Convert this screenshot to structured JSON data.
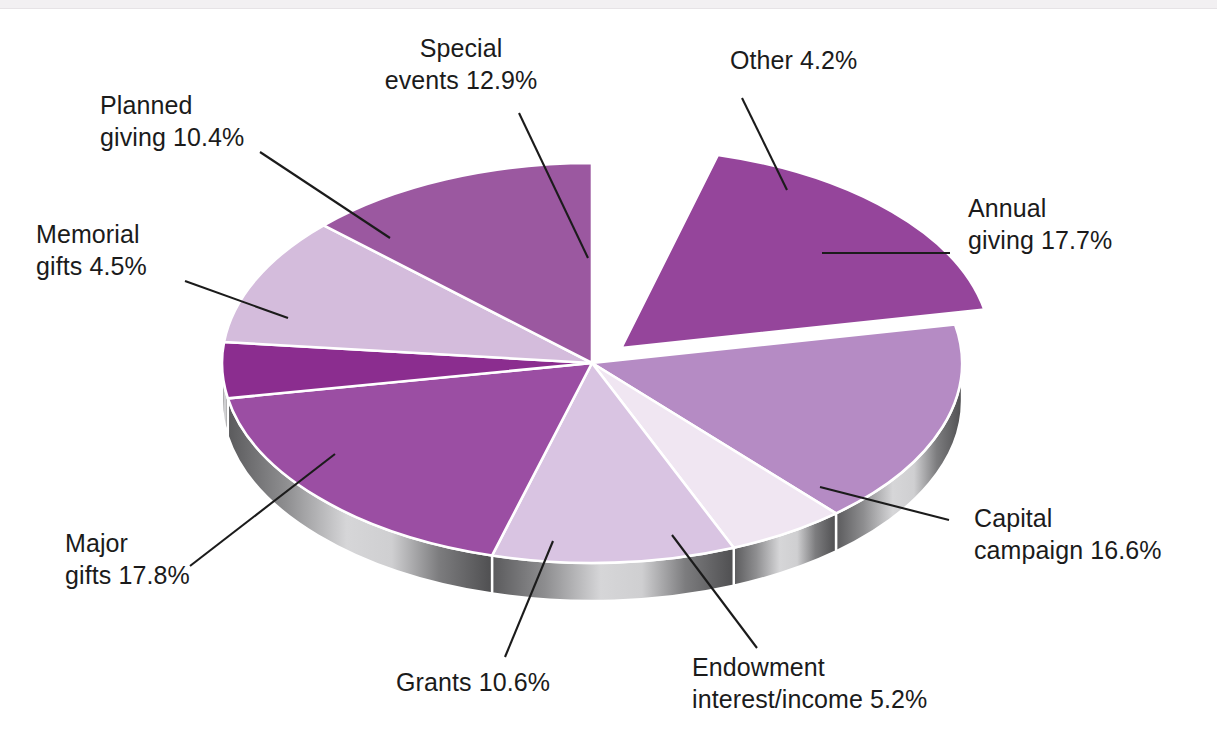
{
  "chart_data": {
    "type": "pie",
    "title": "",
    "subtitle": "",
    "xlabel": "",
    "ylabel": "",
    "legend_position": "callout-labels",
    "grid": false,
    "units": "percent",
    "exploded_slices": [
      "Annual giving"
    ],
    "categories": [
      "Other",
      "Annual giving",
      "Capital campaign",
      "Endowment interest/income",
      "Grants",
      "Major gifts",
      "Memorial gifts",
      "Planned giving",
      "Special events"
    ],
    "values": [
      4.2,
      17.7,
      16.6,
      5.2,
      10.6,
      17.8,
      4.5,
      10.4,
      12.9
    ],
    "slices": [
      {
        "label": "Other",
        "value": 4.2,
        "display": "Other 4.2%",
        "color": "#ffffff",
        "exploded": false
      },
      {
        "label": "Annual giving",
        "value": 17.7,
        "display": "Annual giving 17.7%",
        "color": "#95459b",
        "exploded": true
      },
      {
        "label": "Capital campaign",
        "value": 16.6,
        "display": "Capital campaign 16.6%",
        "color": "#b58bc4",
        "exploded": false
      },
      {
        "label": "Endowment interest/income",
        "value": 5.2,
        "display": "Endowment interest/income 5.2%",
        "color": "#f0e6f2",
        "exploded": false
      },
      {
        "label": "Grants",
        "value": 10.6,
        "display": "Grants 10.6%",
        "color": "#d9c4e2",
        "exploded": false
      },
      {
        "label": "Major gifts",
        "value": 17.8,
        "display": "Major gifts  17.8%",
        "color": "#9b4ea3",
        "exploded": false
      },
      {
        "label": "Memorial gifts",
        "value": 4.5,
        "display": "Memorial gifts 4.5%",
        "color": "#8b2d8f",
        "exploded": false
      },
      {
        "label": "Planned giving",
        "value": 10.4,
        "display": "Planned giving 10.4%",
        "color": "#d4bcdc",
        "exploded": false
      },
      {
        "label": "Special events",
        "value": 12.9,
        "display": "Special events 12.9%",
        "color": "#9b58a0",
        "exploded": false
      }
    ]
  },
  "labels": {
    "special_events_l1": "Special",
    "special_events_l2": "events 12.9%",
    "planned_giving_l1": "Planned",
    "planned_giving_l2": "giving 10.4%",
    "memorial_gifts_l1": "Memorial",
    "memorial_gifts_l2": "gifts 4.5%",
    "major_gifts_l1": "Major",
    "major_gifts_l2": "gifts  17.8%",
    "grants_l1": "Grants 10.6%",
    "endowment_l1": "Endowment",
    "endowment_l2": "interest/income 5.2%",
    "capital_campaign_l1": "Capital",
    "capital_campaign_l2": "campaign 16.6%",
    "annual_giving_l1": "Annual",
    "annual_giving_l2": "giving 17.7%",
    "other_l1": "Other 4.2%"
  },
  "colors": {
    "side_wall_dark": "#565658",
    "side_wall_light": "#d2d2d4",
    "leader_line": "#1b1b1b",
    "separator": "#ffffff",
    "text": "#1b1b1b"
  }
}
